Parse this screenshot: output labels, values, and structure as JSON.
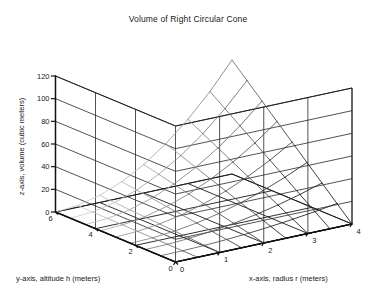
{
  "chart_data": {
    "type": "surface",
    "title": "Volume of Right Circular Cone",
    "xlabel": "x-axis, radius r (meters)",
    "ylabel": "y-axis, altitude h (meters)",
    "zlabel": "z-axis, volume (cubic meters)",
    "formula": "V = (1/3) * pi * r^2 * h",
    "x": [
      0,
      0.5,
      1,
      1.5,
      2,
      2.5,
      3,
      3.5,
      4
    ],
    "y": [
      0,
      0.75,
      1.5,
      2.25,
      3,
      3.75,
      4.5,
      5.25,
      6
    ],
    "xticks": [
      0,
      1,
      2,
      3,
      4
    ],
    "yticks": [
      0,
      2,
      4,
      6
    ],
    "zticks": [
      0,
      20,
      40,
      60,
      80,
      100,
      120
    ],
    "xlim": [
      0,
      4
    ],
    "ylim": [
      0,
      6
    ],
    "zlim": [
      0,
      120
    ],
    "grid": true,
    "legend": "none",
    "z_rows_comment": "z[j][i] = (1/3)*pi*x[i]^2*y[j], rows indexed by y",
    "z": [
      [
        0,
        0,
        0,
        0,
        0,
        0,
        0,
        0,
        0
      ],
      [
        0,
        0.196,
        0.785,
        1.767,
        3.142,
        4.909,
        7.069,
        9.621,
        12.566
      ],
      [
        0,
        0.393,
        1.571,
        3.534,
        6.283,
        9.817,
        14.137,
        19.242,
        25.133
      ],
      [
        0,
        0.589,
        2.356,
        5.301,
        9.425,
        14.726,
        21.206,
        28.863,
        37.699
      ],
      [
        0,
        0.785,
        3.142,
        7.069,
        12.566,
        19.635,
        28.274,
        38.485,
        50.265
      ],
      [
        0,
        0.982,
        3.927,
        8.836,
        15.708,
        24.544,
        35.343,
        48.106,
        62.832
      ],
      [
        0,
        1.178,
        4.712,
        10.603,
        18.85,
        29.452,
        42.412,
        57.727,
        75.398
      ],
      [
        0,
        1.374,
        5.498,
        12.37,
        21.991,
        34.361,
        49.48,
        67.348,
        87.965
      ],
      [
        0,
        1.571,
        6.283,
        14.137,
        25.133,
        39.27,
        56.549,
        76.969,
        100.531
      ]
    ],
    "zmax_observed": 100.5,
    "colors": {
      "background": "#ffffff",
      "axis": "#111111",
      "grid": "#262626",
      "mesh_near": "#1a1a1a",
      "mesh_far": "#c8c8c8"
    }
  },
  "chart": {
    "title": "Volume of Right Circular Cone",
    "xlabel": "x-axis, radius r (meters)",
    "ylabel": "y-axis, altitude h (meters)",
    "zlabel": "z-axis, volume (cubic meters)"
  }
}
